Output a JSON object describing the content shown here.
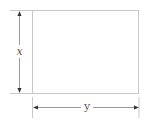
{
  "diagram": {
    "type": "rectangle-dimensions",
    "labels": {
      "height": "x",
      "width": "y"
    },
    "colors": {
      "rectangle_stroke": "#c8c8c8",
      "dimension_line": "#9a9a9a",
      "arrowhead": "#333333",
      "label_text": "#555555",
      "background": "#ffffff"
    }
  }
}
